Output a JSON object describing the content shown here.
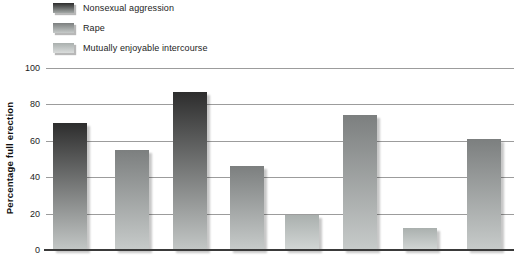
{
  "y_axis": {
    "title": "Percentage full erection",
    "ticks": [
      "100",
      "80",
      "60",
      "40",
      "20",
      "0"
    ]
  },
  "legend": {
    "items": [
      {
        "label": "Nonsexual aggression",
        "color_top": "#2d2d2d",
        "color_bottom": "#c3c7c6",
        "swatch_bottom": "#a3a8a6"
      },
      {
        "label": "Rape",
        "color_top": "#7c7f7f",
        "color_bottom": "#c7cbca",
        "swatch_bottom": "#c6cac9"
      },
      {
        "label": "Mutually enjoyable intercourse",
        "color_top": "#aab0ae",
        "color_bottom": "#d2d6d5",
        "swatch_bottom": "#dadddc"
      }
    ]
  },
  "chart_data": {
    "type": "bar",
    "title": "",
    "ylabel": "Percentage full erection",
    "ylim": [
      0,
      100
    ],
    "yticks": [
      0,
      20,
      40,
      60,
      80,
      100
    ],
    "grid": true,
    "legend_position": "top-left",
    "x_tick_labels": [],
    "bars": [
      {
        "legend_index": 0,
        "category": "Nonsexual aggression",
        "value": 70
      },
      {
        "legend_index": 1,
        "category": "Rape",
        "value": 55
      },
      {
        "legend_index": 0,
        "category": "Nonsexual aggression",
        "value": 87
      },
      {
        "legend_index": 1,
        "category": "Rape",
        "value": 46
      },
      {
        "legend_index": 2,
        "category": "Mutually enjoyable intercourse",
        "value": 19
      },
      {
        "legend_index": 1,
        "category": "Rape",
        "value": 74
      },
      {
        "legend_index": 2,
        "category": "Mutually enjoyable intercourse",
        "value": 12
      },
      {
        "legend_index": 1,
        "category": "Rape",
        "value": 61
      }
    ]
  }
}
